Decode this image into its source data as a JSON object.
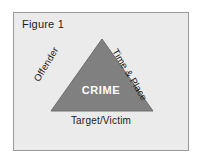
{
  "figure": {
    "caption": "Figure 1",
    "frame_bg_color": "#ebebeb",
    "frame_border_color": "#9a9a9a",
    "page_bg_color": "#ffffff"
  },
  "diagram": {
    "type": "crime-triangle",
    "shape": "triangle",
    "fill_color": "#808080",
    "stroke_color": "#6e6e6e",
    "center_label": "CRIME",
    "center_label_color": "#ffffff",
    "edge_labels": [
      {
        "id": "offender",
        "text": "Offender",
        "position": "left-edge",
        "rotation_deg": -59
      },
      {
        "id": "time-place",
        "text": "Time & Place",
        "position": "right-edge",
        "rotation_deg": 59
      },
      {
        "id": "target-victim",
        "text": "Target/Victim",
        "position": "below-base",
        "rotation_deg": 0
      }
    ],
    "label_color": "#1c1c1c"
  }
}
